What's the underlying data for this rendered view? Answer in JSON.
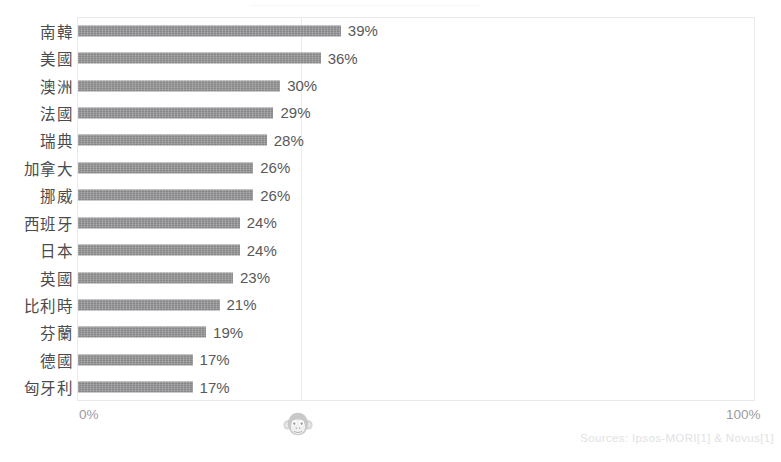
{
  "chart_data": {
    "type": "bar",
    "orientation": "horizontal",
    "title": "",
    "xlabel": "",
    "ylabel": "",
    "categories": [
      "南韓",
      "美國",
      "澳洲",
      "法國",
      "瑞典",
      "加拿大",
      "挪威",
      "西班牙",
      "日本",
      "英國",
      "比利時",
      "芬蘭",
      "德國",
      "匈牙利"
    ],
    "values": [
      39,
      36,
      30,
      29,
      28,
      26,
      26,
      24,
      24,
      23,
      21,
      19,
      17,
      17
    ],
    "value_labels": [
      "39%",
      "36%",
      "30%",
      "29%",
      "28%",
      "26%",
      "26%",
      "24%",
      "24%",
      "23%",
      "21%",
      "19%",
      "17%",
      "17%"
    ],
    "xlim": [
      0,
      100
    ],
    "x_tick_labels": [
      "0%",
      "100%"
    ],
    "grid": true,
    "gridlines_at": [
      33
    ],
    "legend": "none",
    "bar_color": "#8e8e90",
    "unit": "%"
  },
  "axis": {
    "min_label": "0%",
    "max_label": "100%"
  },
  "footer": {
    "source": "Sources: Ipsos-MORI[1] & Novus[1]"
  },
  "watermark": {
    "icon": "monkey-face-icon"
  }
}
